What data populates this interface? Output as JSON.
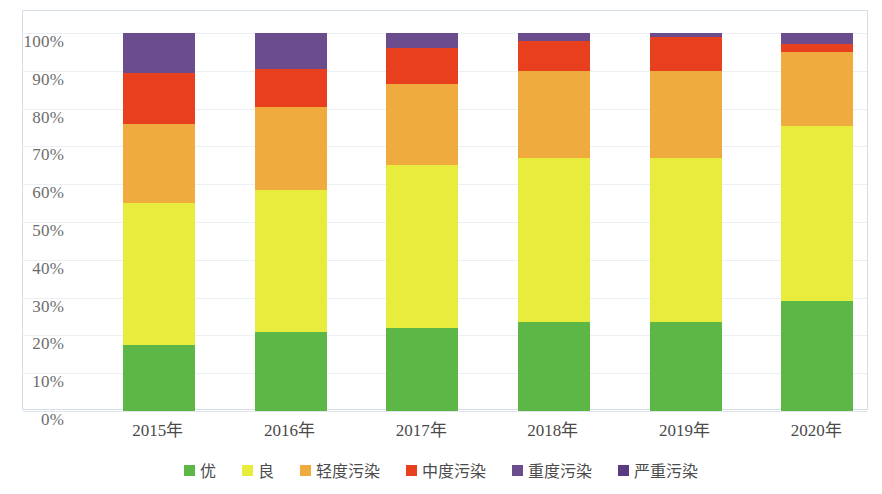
{
  "chart_data": {
    "type": "bar",
    "subtype": "stacked-percentage",
    "title": "",
    "xlabel": "",
    "ylabel": "",
    "ylim": [
      0,
      100
    ],
    "y_unit": "%",
    "grid": true,
    "legend_position": "bottom",
    "categories": [
      "2015年",
      "2016年",
      "2017年",
      "2018年",
      "2019年",
      "2020年"
    ],
    "y_ticks": [
      "0%",
      "10%",
      "20%",
      "30%",
      "40%",
      "50%",
      "60%",
      "70%",
      "80%",
      "90%",
      "100%"
    ],
    "y_tick_values": [
      0,
      10,
      20,
      30,
      40,
      50,
      60,
      70,
      80,
      90,
      100
    ],
    "series": [
      {
        "name": "优",
        "color": "#5cb747",
        "values": [
          17.5,
          21.0,
          22.0,
          23.5,
          23.5,
          29.0
        ]
      },
      {
        "name": "良",
        "color": "#e8ec3c",
        "values": [
          37.5,
          37.5,
          43.0,
          43.5,
          43.5,
          46.5
        ]
      },
      {
        "name": "轻度污染",
        "color": "#efab3e",
        "values": [
          21.0,
          22.0,
          21.5,
          23.0,
          23.0,
          19.5
        ]
      },
      {
        "name": "中度污染",
        "color": "#e8401f",
        "values": [
          13.5,
          10.0,
          9.5,
          8.0,
          9.0,
          2.0
        ]
      },
      {
        "name": "重度污染",
        "color": "#6b4d8e",
        "values": [
          10.5,
          9.5,
          4.0,
          2.0,
          1.0,
          3.0
        ]
      },
      {
        "name": "严重污染",
        "color": "#5a3b82",
        "values": [
          0,
          0,
          0,
          0,
          0,
          0
        ]
      }
    ],
    "stack_boundaries_percent": {
      "2015年": [
        0,
        17.5,
        55.0,
        76.0,
        89.5,
        100
      ],
      "2016年": [
        0,
        21.0,
        58.5,
        80.5,
        90.5,
        100
      ],
      "2017年": [
        0,
        22.0,
        65.0,
        86.5,
        96.0,
        100
      ],
      "2018年": [
        0,
        23.5,
        67.0,
        90.0,
        98.0,
        100
      ],
      "2019年": [
        0,
        23.5,
        67.0,
        90.0,
        99.0,
        100
      ],
      "2020年": [
        0,
        29.0,
        75.5,
        95.0,
        97.0,
        100
      ]
    }
  },
  "legend": {
    "items": [
      {
        "label": "优",
        "color": "#5cb747"
      },
      {
        "label": "良",
        "color": "#e8ec3c"
      },
      {
        "label": "轻度污染",
        "color": "#efab3e"
      },
      {
        "label": "中度污染",
        "color": "#e8401f"
      },
      {
        "label": "重度污染",
        "color": "#6b4d8e"
      },
      {
        "label": "严重污染",
        "color": "#5a3b82"
      }
    ]
  }
}
